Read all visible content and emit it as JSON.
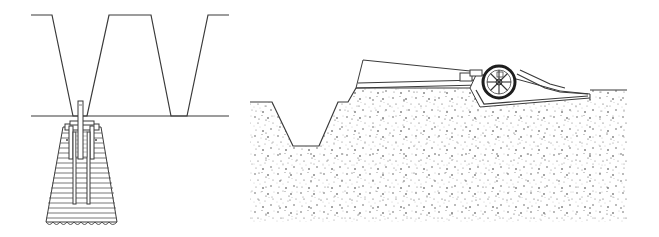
{
  "figure": {
    "description": "Two technical line drawings: left — cross-section of trapezoidal trench profile above a ground line with a tapered timber-cribbed pile/foundation and vertical rod beneath; right — stippled soil cross-section with a trapezoidal ditch, a sloped embankment plate, and a spoked wheel mechanism on an inclined rail.",
    "colors": {
      "line": "#3a3a3a",
      "stipple": "#444444",
      "background": "#ffffff"
    }
  },
  "left_panel": {
    "label": "trench-profile-with-cribbed-foundation",
    "crib_rows": 18,
    "base_teeth": 10
  },
  "right_panel": {
    "label": "stippled-soil-section-with-wheel",
    "wheel_spokes": 8
  }
}
